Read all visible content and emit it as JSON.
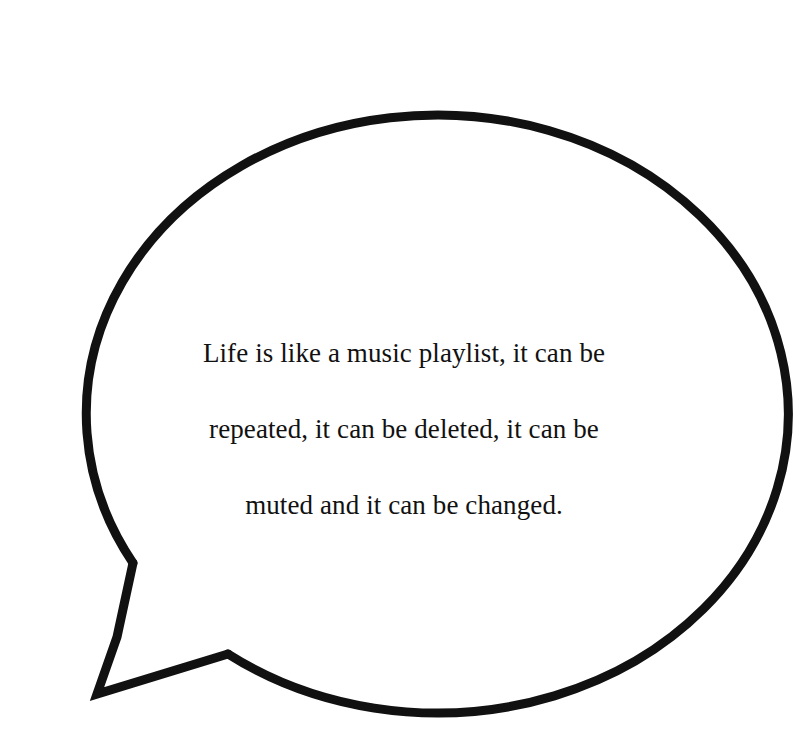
{
  "image": {
    "kind": "speech-bubble-quote-graphic",
    "width": 807,
    "height": 738,
    "background_color": "#ffffff"
  },
  "bubble": {
    "name": "speech-bubble",
    "shape": "ellipse-with-pointed-tail",
    "fill_color": "#ffffff",
    "outline_color": "#111111",
    "outline_width_px": 9,
    "geometry": {
      "center_x": 404,
      "center_y": 355,
      "radius_x": 351,
      "radius_y": 299,
      "tail_top_anchor_x": 133,
      "tail_top_anchor_y": 563,
      "tail_bend_x": 117,
      "tail_bend_y": 637,
      "tail_tip_x": 97,
      "tail_tip_y": 694,
      "tail_right_anchor_x": 228,
      "tail_right_anchor_y": 654
    }
  },
  "quote": {
    "full_text": "Life is like a music playlist, it can be repeated, it can be deleted, it can be muted and it can be changed.",
    "lines": [
      "Life is like a music playlist, it can be",
      "repeated, it can be deleted, it can be",
      "muted and it can be changed."
    ],
    "alignment": "center",
    "text_color": "#111111",
    "font_size_px": 27,
    "line_height_px": 38
  }
}
